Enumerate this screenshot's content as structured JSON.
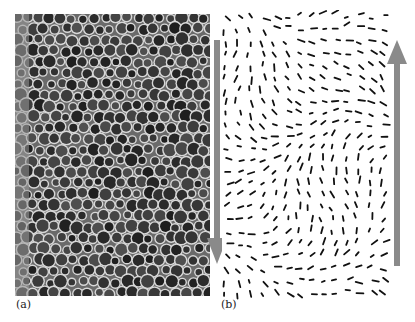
{
  "figure": {
    "panels": [
      {
        "id": "a",
        "label": "(a)",
        "description": "micrograph of close-packed bubble/cell structure",
        "arrow_direction": "down"
      },
      {
        "id": "b",
        "label": "(b)",
        "description": "displacement vector field shown as short dashes",
        "arrow_direction": "up"
      }
    ],
    "colors": {
      "arrow": "#8a8a8a",
      "cell_wall": "#d8d8d8",
      "cell_interior": "#2a2a2a",
      "dash": "#111111"
    }
  }
}
